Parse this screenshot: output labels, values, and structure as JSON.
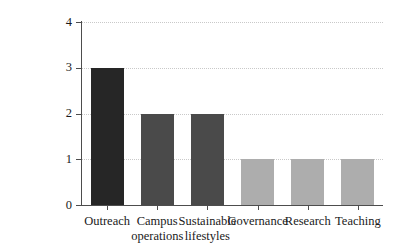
{
  "chart_data": {
    "type": "bar",
    "title": "",
    "subtitle": "",
    "xlabel": "",
    "ylabel": "",
    "categories": [
      "Outreach",
      "Campus operations",
      "Sustainable lifestyles",
      "Governance",
      "Research",
      "Teaching"
    ],
    "category_lines": [
      [
        "Outreach"
      ],
      [
        "Campus",
        "operations"
      ],
      [
        "Sustainable",
        "lifestyles"
      ],
      [
        "Governance"
      ],
      [
        "Research"
      ],
      [
        "Teaching"
      ]
    ],
    "values": [
      3,
      2,
      2,
      1,
      1,
      1
    ],
    "bar_colors": [
      "#262626",
      "#4a4a4a",
      "#4a4a4a",
      "#adadad",
      "#adadad",
      "#adadad"
    ],
    "ylim": [
      0,
      4
    ],
    "yticks": [
      0,
      1,
      2,
      3,
      4
    ],
    "ytick_labels": [
      "0",
      "1",
      "2",
      "3",
      "4"
    ],
    "grid": true,
    "grid_axis": "y",
    "grid_style": "dotted",
    "grid_color": "#c9c9c9",
    "legend": false,
    "legend_position": "none",
    "axis_color": "#4d4d4d",
    "background_color": "#ffffff",
    "annotations": []
  }
}
